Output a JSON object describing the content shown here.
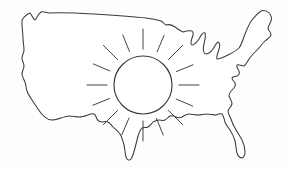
{
  "image": {
    "title": "Outline map of the contiguous United States with a sun over the central plains",
    "style": "hand-drawn line art",
    "width": 286,
    "height": 169,
    "background_color": "#fdfdfc",
    "ink_color": "#3a3a3c"
  },
  "map": {
    "name": "contiguous-united-states",
    "label": "United States outline",
    "fill_color": "#ffffff",
    "stroke_color": "#3a3a3c",
    "stroke_width": 1.05,
    "path": "M 22 20 C 24 17, 27 14, 30 13 C 32 15, 33 19, 35 20 C 37 18, 38 14, 41 12 C 44 11, 46 13, 49 13 C 62 12, 78 13, 95 14 C 112 15, 130 16, 146 18 C 153 19, 158 20, 161 21 C 163 22, 164 24, 166 25 C 169 24, 172 25, 175 27 C 178 29, 180 31, 183 32 C 186 31, 189 30, 192 31 C 194 33, 193 36, 192 38 C 191 41, 190 44, 192 45 C 195 45, 197 42, 199 39 C 201 35, 203 32, 205 33 C 206 36, 205 40, 204 44 C 203 48, 203 52, 205 54 C 208 54, 211 52, 213 49 C 215 46, 216 43, 218 42 C 220 43, 220 46, 219 49 C 218 53, 216 57, 217 59 C 220 59, 224 57, 228 55 C 232 53, 236 51, 239 48 C 242 44, 243 39, 245 34 C 247 29, 249 24, 252 20 C 255 16, 258 13, 261 11 C 264 10, 267 11, 269 13 C 271 15, 272 18, 271 21 C 270 24, 268 26, 268 29 C 269 31, 271 32, 271 35 C 270 38, 267 39, 265 41 C 262 44, 260 47, 257 50 C 254 53, 251 56, 249 59 C 247 62, 246 65, 244 66 C 241 66, 239 64, 237 65 C 236 67, 238 69, 239 71 C 240 73, 239 75, 237 76 C 235 77, 233 76, 232 78 C 232 80, 234 81, 235 83 C 236 85, 235 87, 233 89 C 231 91, 229 93, 229 96 C 230 99, 232 101, 232 104 C 231 107, 229 108, 228 111 C 228 114, 230 116, 231 119 C 232 122, 233 125, 235 128 C 237 132, 240 136, 242 140 C 244 144, 245 148, 245 152 C 245 155, 244 157, 242 158 C 240 158, 238 156, 237 153 C 236 149, 236 145, 235 141 C 234 137, 232 133, 230 130 C 228 127, 226 125, 225 122 C 224 119, 224 116, 222 114 C 220 113, 218 114, 216 115 C 213 115, 210 114, 207 114 C 204 114, 201 115, 198 115 C 195 115, 192 114, 189 114 C 186 114, 184 116, 182 117 C 180 118, 178 118, 176 117 C 174 116, 172 115, 170 116 C 168 117, 167 119, 165 120 C 163 121, 161 120, 159 120 C 157 120, 155 121, 153 122 C 151 124, 150 126, 148 127 C 146 128, 144 127, 142 128 C 140 130, 139 133, 138 136 C 137 140, 136 144, 135 148 C 134 152, 133 156, 131 159 C 129 161, 127 160, 126 157 C 125 153, 125 149, 124 145 C 123 141, 122 137, 120 134 C 118 131, 115 129, 113 127 C 111 125, 110 123, 108 122 C 106 121, 104 122, 102 122 C 100 122, 98 121, 97 119 C 96 117, 96 115, 94 114 C 92 113, 90 114, 88 115 C 85 116, 82 117, 79 117 C 76 117, 73 116, 70 116 C 67 116, 64 117, 61 118 C 58 119, 55 120, 52 120 C 49 120, 47 119, 45 117 C 42 115, 40 112, 38 109 C 36 106, 34 103, 32 100 C 30 97, 28 94, 27 91 C 26 88, 26 85, 25 82 C 24 79, 22 77, 22 74 C 22 71, 24 69, 24 66 C 24 63, 22 61, 22 58 C 22 55, 24 53, 24 50 C 24 46, 23 42, 23 38 C 23 33, 22 28, 22 24 Z"
  },
  "sun": {
    "name": "sun",
    "label": "Sun",
    "center_x": 143,
    "center_y": 85,
    "disc_radius": 29,
    "stroke_color": "#3a3a3c",
    "ray_count": 16,
    "ray_inner_radius": 36,
    "ray_outer_radius": 56,
    "rays": [
      {
        "angle_deg": 0,
        "inner": 36,
        "outer": 56
      },
      {
        "angle_deg": 22,
        "inner": 36,
        "outer": 54
      },
      {
        "angle_deg": 45,
        "inner": 36,
        "outer": 56
      },
      {
        "angle_deg": 67,
        "inner": 36,
        "outer": 54
      },
      {
        "angle_deg": 90,
        "inner": 36,
        "outer": 56
      },
      {
        "angle_deg": 112,
        "inner": 36,
        "outer": 54
      },
      {
        "angle_deg": 135,
        "inner": 36,
        "outer": 56
      },
      {
        "angle_deg": 157,
        "inner": 36,
        "outer": 54
      },
      {
        "angle_deg": 180,
        "inner": 36,
        "outer": 56
      },
      {
        "angle_deg": 202,
        "inner": 36,
        "outer": 54
      },
      {
        "angle_deg": 225,
        "inner": 36,
        "outer": 56
      },
      {
        "angle_deg": 247,
        "inner": 36,
        "outer": 54
      },
      {
        "angle_deg": 270,
        "inner": 36,
        "outer": 56
      },
      {
        "angle_deg": 292,
        "inner": 36,
        "outer": 54
      },
      {
        "angle_deg": 315,
        "inner": 36,
        "outer": 56
      },
      {
        "angle_deg": 337,
        "inner": 36,
        "outer": 54
      }
    ]
  }
}
